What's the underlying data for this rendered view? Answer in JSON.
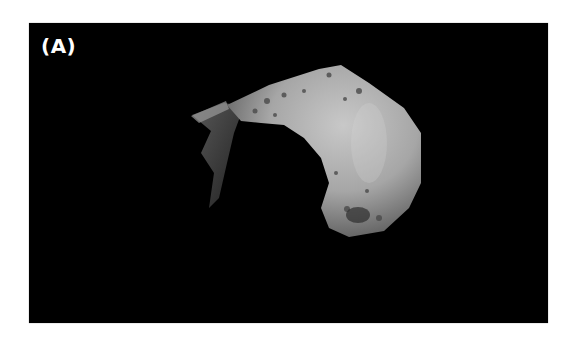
{
  "figure": {
    "panel_label": "(A)",
    "colors": {
      "background": "#000000",
      "page": "#ffffff",
      "label": "#ffffff",
      "asteroid_light": "#bdbdbd",
      "asteroid_mid": "#8a8a8a",
      "asteroid_dark": "#3a3a3a"
    }
  }
}
